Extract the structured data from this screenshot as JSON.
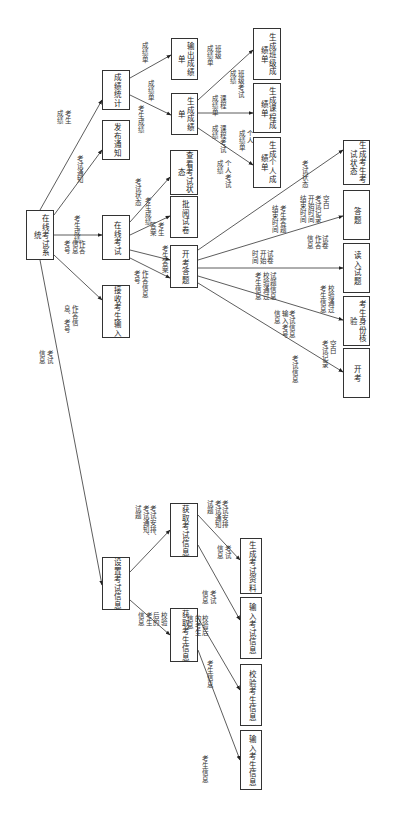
{
  "title": "在线考试系统",
  "nodes": {
    "root": "在线考试系统",
    "score_stats": "成绩统计",
    "publish_notice": "发布通知",
    "online_exam": "在线考试",
    "receive_input": "接收考生输入",
    "set_exam_info": "设置考试信息",
    "output_report": "输出成绩单",
    "gen_report": "生成成绩单",
    "view_status": "查看考试状态",
    "grade_papers": "批阅试卷",
    "start_answer": "开考答题",
    "get_exam_info": "获取考试信息",
    "get_student_info": "获取考生信息",
    "gen_class_report": "生成班级成绩单",
    "gen_course_report": "生成课程成绩单",
    "gen_personal_report": "生成个人成绩单",
    "gen_student_status": "生成考生考试状态",
    "answer": "答题",
    "read_questions": "读入试题",
    "verify_identity": "考生身份核验",
    "start_exam": "开考",
    "gen_exam_material": "生成考试资料",
    "input_exam_info": "输入考试信息",
    "verify_student_info": "校验考生信息",
    "input_student_info": "输入考生信息"
  },
  "flows": {
    "f1": "考生\n成绩",
    "f2": "考试通知",
    "f3": "考生成绩",
    "f4": "考试信息",
    "f5": "作答\n信息\n考号",
    "f6": "作答信\n息、考号",
    "f7": "考试\n信息",
    "f8": "成绩单",
    "f9": "成绩单",
    "f10": "考生成绩",
    "f11": "班级\n成绩单",
    "f12": "班级考试\n成绩",
    "f13": "课程\n成绩单",
    "f14": "课程考试\n成绩",
    "f15": "个人\n成绩单",
    "f16": "个人考试\n成绩",
    "f17": "考试状态",
    "f18": "考生成绩",
    "f19": "考生\n答案",
    "f20": "考生答案",
    "f21": "考试状态",
    "f22": "作答信息\n考号",
    "f23": "考试状态",
    "f24": "空白\n考试记录\n开始时间\n结束时间",
    "f25": "考生答题\n结束时间",
    "f26": "试卷\n作答\n信息",
    "f27": "试卷\n开始\n时间",
    "f28": "试题信息\n校验通过\n考生信息",
    "f29": "校验通过\n考生信息",
    "f30": "考试信息\n输入考号\n信息",
    "f31": "空白\n考试记录",
    "f32": "考试信息",
    "f33": "考试安排\n考试通知\n试题",
    "f34": "考试安排、\n考试通知、\n试题",
    "f35": "考试\n信息",
    "f36": "考试\n信息",
    "f37": "校验\n后的\n考生\n信息",
    "f38": "校验后\n的考生\n信息",
    "f39": "考生信息",
    "f40": "考生信息"
  }
}
